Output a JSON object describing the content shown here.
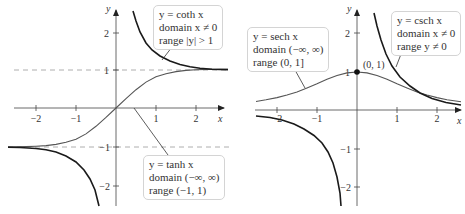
{
  "left_plot": {
    "axis_labels": {
      "x": "x",
      "y": "y"
    },
    "x_ticks": [
      "−2",
      "−1",
      "1",
      "2"
    ],
    "y_ticks": [
      "2",
      "1",
      "−1",
      "−2"
    ],
    "coth_box": {
      "line1": "y = coth x",
      "line2": "domain x ≠ 0",
      "line3": "range |y| > 1"
    },
    "tanh_box": {
      "line1": "y = tanh x",
      "line2": "domain (−∞, ∞)",
      "line3": "range (−1, 1)"
    }
  },
  "right_plot": {
    "axis_labels": {
      "x": "x",
      "y": "y"
    },
    "x_ticks": [
      "−2",
      "−1",
      "1",
      "2"
    ],
    "y_ticks": [
      "2",
      "1",
      "−1",
      "−2"
    ],
    "point_label": "(0, 1)",
    "sech_box": {
      "line1": "y = sech x",
      "line2": "domain (−∞, ∞)",
      "line3": "range (0, 1]"
    },
    "csch_box": {
      "line1": "y = csch x",
      "line2": "domain x ≠ 0",
      "line3": "range y ≠ 0"
    }
  },
  "colors": {
    "reciprocal_curve": "#1a1a1a",
    "base_curve": "#555555",
    "axis": "#444444",
    "asymptote": "#999999",
    "box_border": "#d4d4d4"
  }
}
